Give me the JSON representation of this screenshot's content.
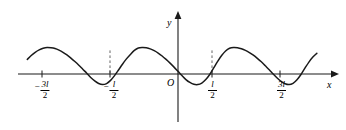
{
  "figure": {
    "background_color": "#ffffff",
    "stroke_color": "#1a1a1a",
    "width": 346,
    "height": 130
  },
  "axes": {
    "x_label": "x",
    "y_label": "y",
    "origin_label": "O"
  },
  "ticks": [
    {
      "id": "neg-3l-2",
      "sign": "−",
      "numerator": "3l",
      "denominator": "2",
      "x_px": 42,
      "value": -1.5
    },
    {
      "id": "neg-l-2",
      "sign": "−",
      "numerator": "l",
      "denominator": "2",
      "x_px": 110,
      "value": -0.5
    },
    {
      "id": "pos-l-2",
      "sign": "",
      "numerator": "l",
      "denominator": "2",
      "x_px": 212,
      "value": 0.5
    },
    {
      "id": "pos-3l-2",
      "sign": "",
      "numerator": "3l",
      "denominator": "2",
      "x_px": 280,
      "value": 1.5
    }
  ],
  "chart_data": {
    "type": "line",
    "title": "",
    "subtitle": "",
    "xlabel": "x",
    "ylabel": "y",
    "grid": false,
    "legend": "none",
    "x_unit": "l",
    "xlim": [
      -1.95,
      1.78
    ],
    "ylim": [
      -0.45,
      1.05
    ],
    "period": 1.0,
    "peak_value": 1.0,
    "trough_value": -0.4,
    "xtick_values": [
      -1.5,
      -0.5,
      0.5,
      1.5
    ],
    "xtick_labels": [
      "-3l/2",
      "-l/2",
      "l/2",
      "3l/2"
    ],
    "ytick_values": [],
    "ytick_labels": [],
    "annotations": [
      {
        "type": "dashed-vertical",
        "x": -0.5,
        "y0": 0,
        "y1": 1.0
      },
      {
        "type": "dashed-vertical",
        "x": 0.5,
        "y0": 0,
        "y1": 1.0
      }
    ],
    "series": [
      {
        "name": "f(x)",
        "x": [
          -1.9,
          -1.85,
          -1.8,
          -1.75,
          -1.7,
          -1.65,
          -1.6,
          -1.55,
          -1.5,
          -1.45,
          -1.4,
          -1.35,
          -1.3,
          -1.25,
          -1.2,
          -1.15,
          -1.1,
          -1.05,
          -1.0,
          -0.95,
          -0.9,
          -0.85,
          -0.8,
          -0.75,
          -0.7,
          -0.65,
          -0.6,
          -0.55,
          -0.5,
          -0.45,
          -0.4,
          -0.35,
          -0.3,
          -0.25,
          -0.2,
          -0.15,
          -0.1,
          -0.05,
          0.0,
          0.05,
          0.1,
          0.15,
          0.2,
          0.25,
          0.3,
          0.35,
          0.4,
          0.45,
          0.5,
          0.55,
          0.6,
          0.65,
          0.7,
          0.75,
          0.8,
          0.85,
          0.9,
          0.95,
          1.0,
          1.05,
          1.1,
          1.15,
          1.2,
          1.25,
          1.3,
          1.35,
          1.4,
          1.45,
          1.5,
          1.55,
          1.6,
          1.65,
          1.7,
          1.75
        ],
        "y": [
          0.55,
          0.7,
          0.82,
          0.91,
          0.97,
          1.0,
          0.99,
          0.96,
          0.9,
          0.82,
          0.72,
          0.6,
          0.47,
          0.33,
          0.18,
          0.03,
          -0.13,
          -0.26,
          -0.36,
          -0.4,
          -0.36,
          -0.24,
          -0.06,
          0.15,
          0.37,
          0.57,
          0.74,
          0.89,
          0.98,
          1.0,
          0.99,
          0.95,
          0.88,
          0.79,
          0.68,
          0.55,
          0.41,
          0.26,
          0.1,
          -0.06,
          -0.21,
          -0.32,
          -0.39,
          -0.4,
          -0.34,
          -0.21,
          -0.02,
          0.23,
          0.48,
          0.7,
          0.87,
          0.97,
          1.0,
          0.99,
          0.95,
          0.89,
          0.81,
          0.71,
          0.59,
          0.46,
          0.31,
          0.16,
          0.0,
          -0.15,
          -0.28,
          -0.37,
          -0.4,
          -0.35,
          -0.22,
          -0.02,
          0.22,
          0.45,
          0.64,
          0.78
        ]
      }
    ]
  }
}
